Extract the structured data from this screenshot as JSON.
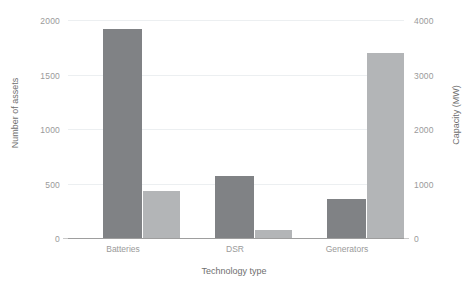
{
  "chart_data": {
    "type": "bar",
    "title": "",
    "xlabel": "Technology type",
    "ylabel": "Number of assets",
    "ylabel_secondary": "Capacity (MW)",
    "categories": [
      "Batteries",
      "DSR",
      "Generators"
    ],
    "series": [
      {
        "name": "Number of assets",
        "axis": "left",
        "color": "#808285",
        "values": [
          1920,
          565,
          360
        ]
      },
      {
        "name": "Capacity (MW)",
        "axis": "right",
        "color": "#b3b5b7",
        "values": [
          860,
          145,
          3400
        ]
      }
    ],
    "ylim": [
      0,
      2000
    ],
    "ylim_secondary": [
      0,
      4000
    ],
    "yticks": [
      0,
      500,
      1000,
      1500,
      2000
    ],
    "yticks_secondary": [
      0,
      1000,
      2000,
      3000,
      4000
    ],
    "ytick_labels": [
      "0",
      "500",
      "1000",
      "1500",
      "2000"
    ],
    "ytick_labels_secondary": [
      "0",
      "1000",
      "2000",
      "3000",
      "4000"
    ],
    "grid": true,
    "grid_color": "#eceff1",
    "legend": "none",
    "background": "#ffffff",
    "axis_color": "#9e9e9e",
    "tick_text_color": "#9a9a9a",
    "label_text_color": "#6f6f6f"
  }
}
